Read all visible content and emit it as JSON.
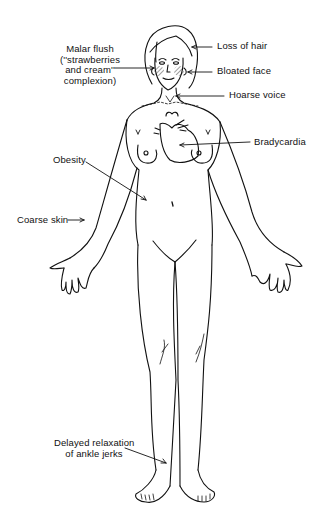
{
  "figure": {
    "labels": {
      "malar_flush": [
        "Malar flush",
        "(''strawberries",
        "and cream''",
        "complexion)"
      ],
      "loss_of_hair": "Loss of hair",
      "bloated_face": "Bloated face",
      "hoarse_voice": "Hoarse voice",
      "bradycardia": "Bradycardia",
      "obesity": "Obesity",
      "coarse_skin": "Coarse skin",
      "ankle_jerks": [
        "Delayed relaxation",
        "of ankle jerks"
      ]
    },
    "colors": {
      "ink": "#111111",
      "background": "#ffffff"
    }
  }
}
